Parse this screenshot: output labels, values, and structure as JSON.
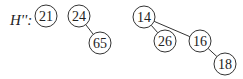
{
  "heap_label": "H'':",
  "nodes": [
    {
      "id": "n21",
      "value": "21",
      "cx": 46,
      "cy": 16
    },
    {
      "id": "n24",
      "value": "24",
      "cx": 79,
      "cy": 16
    },
    {
      "id": "n65",
      "value": "65",
      "cx": 100,
      "cy": 43
    },
    {
      "id": "n14",
      "value": "14",
      "cx": 144,
      "cy": 17
    },
    {
      "id": "n26",
      "value": "26",
      "cx": 165,
      "cy": 41
    },
    {
      "id": "n16",
      "value": "16",
      "cx": 200,
      "cy": 41
    },
    {
      "id": "n18",
      "value": "18",
      "cx": 225,
      "cy": 64
    }
  ],
  "edges": [
    {
      "from": "24",
      "to": "65"
    },
    {
      "from": "14",
      "to": "26"
    },
    {
      "from": "14",
      "to": "16"
    },
    {
      "from": "16",
      "to": "18"
    }
  ]
}
